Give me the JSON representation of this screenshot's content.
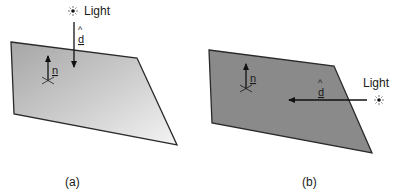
{
  "panels": [
    {
      "id": "a",
      "caption": "(a)",
      "light_label": "Light",
      "direction_vector_label": "d",
      "direction_vector_hat": "^",
      "normal_vector_label": "n",
      "surface_shading": "gradient",
      "colors": {
        "surface_dark": "#a9a9a9",
        "surface_light": "#f2f2f2"
      }
    },
    {
      "id": "b",
      "caption": "(b)",
      "light_label": "Light",
      "direction_vector_label": "d",
      "direction_vector_hat": "^",
      "normal_vector_label": "n",
      "surface_shading": "flat",
      "colors": {
        "surface": "#8a8a8a"
      }
    }
  ],
  "icons": {
    "light_source": "sun-icon"
  }
}
